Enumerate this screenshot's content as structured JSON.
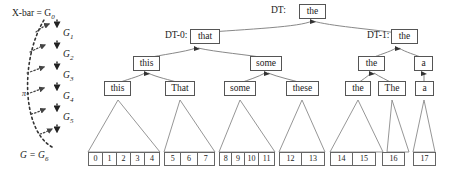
{
  "figure": {
    "type": "derivation-tree-diagram",
    "left_chain": {
      "top_label": "X-bar = G",
      "top_sub": "0",
      "bottom_label": "G = G",
      "bottom_sub": "6",
      "arc_label": "π",
      "nodes": [
        {
          "label": "G",
          "sub": "1"
        },
        {
          "label": "G",
          "sub": "2"
        },
        {
          "label": "G",
          "sub": "3"
        },
        {
          "label": "G",
          "sub": "4"
        },
        {
          "label": "G",
          "sub": "5"
        }
      ]
    },
    "tree": {
      "root": {
        "tag": "DT:",
        "word": "the"
      },
      "level1": [
        {
          "tag": "DT-0:",
          "word": "that"
        },
        {
          "tag": "DT-1:",
          "word": "the"
        }
      ],
      "level2": [
        "this",
        "some",
        "the",
        "a"
      ],
      "level3": [
        "this",
        "That",
        "some",
        "these",
        "the",
        "The",
        "a"
      ],
      "leaf_groups": [
        [
          "0",
          "1",
          "2",
          "3",
          "4"
        ],
        [
          "5",
          "6",
          "7"
        ],
        [
          "8",
          "9",
          "10",
          "11"
        ],
        [
          "12",
          "13"
        ],
        [
          "14",
          "15"
        ],
        [
          "16"
        ],
        [
          "17"
        ]
      ]
    }
  },
  "colors": {
    "box_border": "#555555",
    "line": "#7a7a7a",
    "text": "#1a1a1a",
    "background": "#ffffff"
  }
}
